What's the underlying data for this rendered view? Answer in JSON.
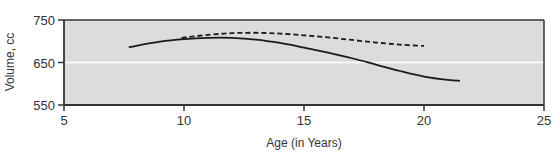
{
  "chart_data": {
    "type": "line",
    "title": "",
    "xlabel": "Age (in Years)",
    "ylabel": "Volume, cc",
    "xlim": [
      5,
      25
    ],
    "ylim": [
      550,
      750
    ],
    "xticks": [
      5,
      10,
      15,
      20,
      25
    ],
    "yticks": [
      550,
      650,
      750
    ],
    "grid": {
      "horizontal": [
        650
      ],
      "color": "#ffffff"
    },
    "legend": null,
    "colors": {
      "background": "#dcdcdc",
      "frame": "#333333",
      "line": "#1a1a1a"
    },
    "series": [
      {
        "name": "solid",
        "style": "solid",
        "x": [
          7.7,
          9,
          10,
          11,
          12,
          13,
          14,
          15,
          16,
          17,
          18,
          19,
          20,
          21,
          21.5
        ],
        "y": [
          686,
          699,
          705,
          708,
          708,
          704,
          696,
          685,
          673,
          660,
          645,
          630,
          617,
          609,
          607
        ]
      },
      {
        "name": "dashed",
        "style": "dashed",
        "x": [
          9.9,
          11,
          12,
          13,
          14,
          15,
          16,
          17,
          18,
          19,
          20
        ],
        "y": [
          708,
          715,
          719,
          720,
          718,
          714,
          709,
          703,
          697,
          692,
          689
        ]
      }
    ]
  }
}
